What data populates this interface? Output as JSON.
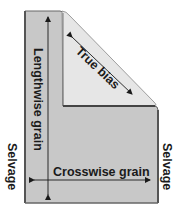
{
  "diagram": {
    "labels": {
      "lengthwise": "Lengthwise grain",
      "crosswise": "Crosswise grain",
      "bias": "True bias",
      "selvage_left": "Selvage",
      "selvage_right": "Selvage"
    },
    "colors": {
      "fabric": "#c8c8c8",
      "fold": "#e4e4e4",
      "edge": "#555555",
      "text": "#1a1a1a"
    }
  }
}
